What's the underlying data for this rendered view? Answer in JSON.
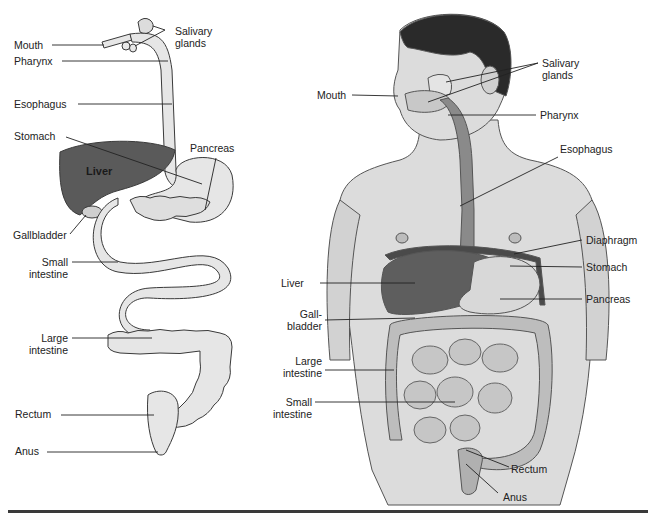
{
  "figure": {
    "left_panel": {
      "name": "Schematic digestive tract",
      "labels": {
        "mouth": "Mouth",
        "salivary_glands": "Salivary\nglands",
        "pharynx": "Pharynx",
        "esophagus": "Esophagus",
        "stomach": "Stomach",
        "pancreas": "Pancreas",
        "liver": "Liver",
        "gallbladder": "Gallbladder",
        "small_intestine": "Small\nintestine",
        "large_intestine": "Large\nintestine",
        "rectum": "Rectum",
        "anus": "Anus"
      }
    },
    "right_panel": {
      "name": "Digestive organs in the human torso",
      "labels": {
        "salivary_glands": "Salivary\nglands",
        "mouth": "Mouth",
        "pharynx": "Pharynx",
        "esophagus": "Esophagus",
        "diaphragm": "Diaphragm",
        "liver": "Liver",
        "stomach": "Stomach",
        "pancreas": "Pancreas",
        "gallbladder": "Gall-\nbladder",
        "large_intestine": "Large\nintestine",
        "small_intestine": "Small\nintestine",
        "rectum": "Rectum",
        "anus": "Anus"
      }
    },
    "colors": {
      "organ_fill": "#e6e6e6",
      "liver_fill": "#5a5a5a",
      "outline": "#3a3a3a",
      "skin": "#d9d9d9",
      "hair": "#2a2a2a",
      "rule": "#3a3a3a"
    }
  }
}
